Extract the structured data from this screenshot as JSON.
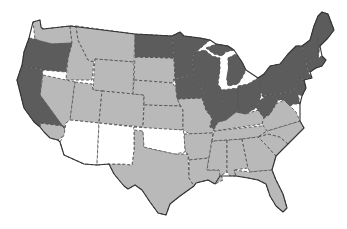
{
  "map": {
    "title": "United States choropleth map",
    "legend_visible": false,
    "colors": {
      "dark": "#5c5c5c",
      "light": "#b9b9b9",
      "white": "#ffffff",
      "border": "#555555",
      "background": "#ffffff"
    },
    "categories": {
      "dark": [
        "WA-none",
        "OR",
        "CA-north",
        "ND",
        "MN",
        "WI",
        "IA",
        "IL",
        "IN",
        "MI",
        "OH",
        "PA",
        "NY",
        "NJ",
        "MD",
        "DE",
        "CT",
        "RI",
        "MA",
        "VT",
        "NH",
        "ME",
        "WV"
      ],
      "white": [
        "AZ",
        "NM",
        "OK"
      ],
      "light": [
        "WA",
        "ID",
        "MT",
        "NV",
        "CA-south",
        "UT",
        "WY",
        "CO",
        "SD",
        "NE",
        "KS",
        "TX",
        "MO",
        "AR",
        "LA",
        "MS",
        "AL",
        "TN",
        "KY",
        "GA",
        "FL",
        "SC",
        "NC",
        "VA"
      ]
    }
  }
}
